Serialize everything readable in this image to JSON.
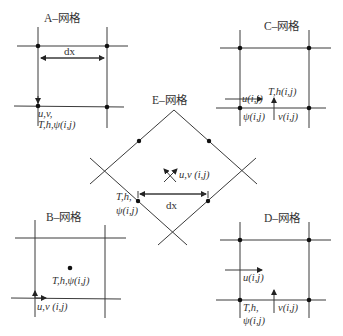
{
  "diagram": {
    "line_color": "#3a3a3a",
    "grids": {
      "A": {
        "title": "A–网格",
        "dx_label": "dx",
        "label_line1": "u,v,",
        "label_line2": "T,h,ψ(i,j)"
      },
      "B": {
        "title": "B–网格",
        "center_label": "T,h,ψ(i,j)",
        "corner_label": "u,v (i,j)"
      },
      "C": {
        "title": "C–网格",
        "center_label": "T,h(i,j)",
        "u_label": "u(i,j)",
        "psi_label": "ψ(i,j)",
        "v_label": "v(i,j)"
      },
      "D": {
        "title": "D–网格",
        "u_label": "u(i,j)",
        "corner_label_line1": "T,h,",
        "corner_label_line2": "ψ(i,j)",
        "v_label": "v(i,j)"
      },
      "E": {
        "title": "E–网格",
        "center_label": "u,v (i,j)",
        "dx_label": "dx",
        "corner_label_line1": "T,h,",
        "corner_label_line2": "ψ(i,j)"
      }
    }
  }
}
